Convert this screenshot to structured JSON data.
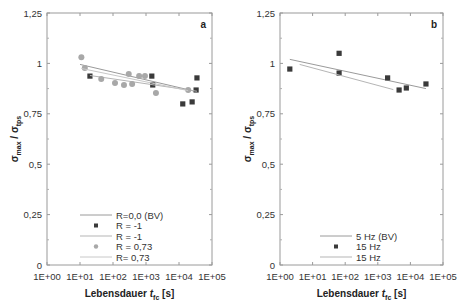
{
  "chart_data": [
    {
      "type": "scatter",
      "panel_label": "a",
      "xscale": "log",
      "xlabel": "Lebensdauer t_fc [s]",
      "xlabel_main": "Lebensdauer ",
      "xlabel_var": "t",
      "xlabel_sub": "fc",
      "xlabel_unit": " [s]",
      "ylabel": "σmax / σtps",
      "xlim": [
        1,
        100000
      ],
      "ylim": [
        0,
        1.25
      ],
      "xticks": [
        "1E+00",
        "1E+01",
        "1E+02",
        "1E+03",
        "1E+04",
        "1E+05"
      ],
      "yticks": [
        "0",
        "0,25",
        "0,5",
        "0,75",
        "1",
        "1,25"
      ],
      "grid": false,
      "legend_position": "lower center",
      "series": [
        {
          "name": "R=0,0 (BV)",
          "kind": "line",
          "color": "#9a9a9a",
          "x": [
            10,
            30000
          ],
          "y": [
            0.995,
            0.862
          ]
        },
        {
          "name": "R = -1",
          "kind": "marker-square",
          "color": "#3a3a3a",
          "x": [
            20,
            1500,
            1600,
            13000,
            25000,
            33000,
            35000
          ],
          "y": [
            0.937,
            0.937,
            0.893,
            0.799,
            0.809,
            0.868,
            0.928
          ]
        },
        {
          "name": "R = -1",
          "kind": "line",
          "color": "#b5b5b5",
          "x": [
            20,
            35000
          ],
          "y": [
            0.94,
            0.862
          ]
        },
        {
          "name": "R = 0,73",
          "kind": "marker-circle",
          "color": "#a8a8a8",
          "x": [
            11,
            14,
            44,
            115,
            215,
            300,
            380,
            620,
            930,
            2000,
            19000
          ],
          "y": [
            1.03,
            0.977,
            0.923,
            0.903,
            0.893,
            0.947,
            0.898,
            0.937,
            0.937,
            0.853,
            0.868
          ]
        },
        {
          "name": "R= 0,73",
          "kind": "line",
          "color": "#c8c8c8",
          "x": [
            11,
            19000
          ],
          "y": [
            0.975,
            0.865
          ]
        }
      ]
    },
    {
      "type": "scatter",
      "panel_label": "b",
      "xscale": "log",
      "xlabel": "Lebensdauer t_fc [s]",
      "xlabel_main": "Lebensdauer ",
      "xlabel_var": "t",
      "xlabel_sub": "fc",
      "xlabel_unit": " [s]",
      "ylabel": "σmax / σtps",
      "xlim": [
        1,
        100000
      ],
      "ylim": [
        0,
        1.25
      ],
      "xticks": [
        "1E+00",
        "1E+01",
        "1E+02",
        "1E+03",
        "1E+04",
        "1E+05"
      ],
      "yticks": [
        "0",
        "0,25",
        "0,5",
        "0,75",
        "1",
        "1,25"
      ],
      "grid": false,
      "legend_position": "lower center",
      "series": [
        {
          "name": "5 Hz (BV)",
          "kind": "line",
          "color": "#9a9a9a",
          "x": [
            2,
            30000
          ],
          "y": [
            1.02,
            0.875
          ]
        },
        {
          "name": "15 Hz",
          "kind": "marker-square",
          "color": "#3a3a3a",
          "x": [
            2,
            65,
            65,
            2000,
            4500,
            7500,
            30000
          ],
          "y": [
            0.972,
            1.05,
            0.952,
            0.928,
            0.868,
            0.878,
            0.898
          ]
        },
        {
          "name": "15 Hz",
          "kind": "line",
          "color": "#b5b5b5",
          "x": [
            4,
            3000
          ],
          "y": [
            0.995,
            0.87
          ]
        }
      ]
    }
  ],
  "panels": [
    {
      "letter": "a",
      "legend": [
        "R=0,0 (BV)",
        "R = -1",
        "R = -1",
        "R = 0,73",
        "R= 0,73"
      ]
    },
    {
      "letter": "b",
      "legend": [
        "5 Hz (BV)",
        "15 Hz",
        "15 Hz"
      ]
    }
  ]
}
